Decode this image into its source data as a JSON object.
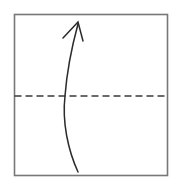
{
  "figure": {
    "title": "Curved upward arrow crossing a horizontal dashed fold line inside a square",
    "caption": "",
    "background_color": "#ffffff",
    "canvas": {
      "width": 176,
      "height": 188
    },
    "square": {
      "label": "Square boundary",
      "x": 14.5,
      "y": 14.5,
      "width": 153,
      "height": 161,
      "stroke_color": "#777777",
      "stroke_width": 1.6,
      "fill": "none"
    },
    "fold_line": {
      "label": "Horizontal dashed center line",
      "x1": 14.5,
      "y1": 96,
      "x2": 167.5,
      "y2": 96,
      "stroke_color": "#3a3a3a",
      "stroke_width": 1.5,
      "dash_length": 7,
      "dash_gap": 4
    },
    "arrow": {
      "label": "Curved arrow pointing up",
      "stroke_color": "#2b2b2b",
      "stroke_width": 1.5,
      "tail_point": {
        "x": 78,
        "y": 172
      },
      "crossing_point": {
        "x": 65,
        "y": 96
      },
      "tip_point": {
        "x": 78,
        "y": 22
      },
      "path": "M 78 172 C 68 150 62 122 65 96 C 67 70 72 46 78 24",
      "head": {
        "label": "Arrowhead chevron",
        "path": "M 63 38 L 78 22 L 83 41",
        "style": "open-v"
      }
    }
  }
}
